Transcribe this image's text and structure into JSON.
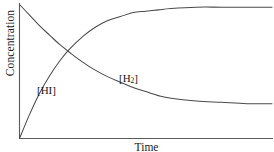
{
  "chart_data": {
    "type": "line",
    "title": "",
    "subtitle": "",
    "xlabel": "Time",
    "ylabel": "Concentration",
    "grid": false,
    "legend_position": "inline-annotations",
    "xlim": [
      0,
      100
    ],
    "ylim": [
      0,
      100
    ],
    "axis_ticks": {
      "x": [],
      "y": []
    },
    "annotations": [
      {
        "text": "[HI]",
        "series": "HI",
        "x": 8,
        "y": 38
      },
      {
        "text": "[H2]",
        "series": "H2",
        "x": 40,
        "y": 50
      }
    ],
    "series": [
      {
        "name": "[HI]",
        "label_html": "[HI]",
        "description": "Reactant concentration decaying exponentially to an equilibrium plateau",
        "color": "#4a4a4a",
        "start_value": 100,
        "plateau_value": 26,
        "x": [
          0,
          4,
          8,
          12,
          16,
          20,
          25,
          30,
          35,
          40,
          45,
          50,
          55,
          60,
          70,
          80,
          90,
          100
        ],
        "y": [
          100,
          92,
          84,
          77,
          70,
          64,
          57,
          51,
          46,
          42,
          38,
          35,
          32,
          30,
          28,
          27,
          26,
          26
        ]
      },
      {
        "name": "[H2]",
        "label_html": "[H<sub>2</sub>]",
        "description": "Product concentration rising to an equilibrium plateau",
        "color": "#4a4a4a",
        "start_value": 0,
        "plateau_value": 98,
        "x": [
          0,
          4,
          8,
          12,
          16,
          20,
          25,
          30,
          35,
          40,
          45,
          50,
          55,
          60,
          70,
          80,
          90,
          100
        ],
        "y": [
          0,
          18,
          34,
          47,
          58,
          67,
          76,
          83,
          88,
          91,
          94,
          95,
          96,
          97,
          98,
          98,
          98,
          98
        ]
      }
    ]
  },
  "labels": {
    "y_axis": "Concentration",
    "x_axis": "Time",
    "hi_label": "[HI]",
    "h2_label_prefix": "[H",
    "h2_label_subscript": "2",
    "h2_label_suffix": "]"
  },
  "colors": {
    "curve": "#4a4a4a",
    "axis": "#5a5a5a",
    "text": "#1c1c1c",
    "background": "#ffffff"
  }
}
